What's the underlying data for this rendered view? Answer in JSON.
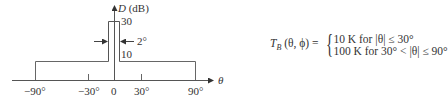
{
  "diagram": {
    "type": "piecewise directivity pattern",
    "y_axis": {
      "label_var": "D",
      "label_unit": "(dB)",
      "ticks": [
        "30",
        "10"
      ]
    },
    "x_axis": {
      "label": "θ",
      "ticks": [
        "−90°",
        "−30°",
        "0",
        "30°",
        "90°"
      ]
    },
    "annotations": {
      "beamwidth": "2°"
    },
    "levels": [
      {
        "name": "main_lobe",
        "value_db": 30,
        "width_deg": 2
      },
      {
        "name": "sidelobe",
        "value_db": 10,
        "range_deg": [
          -90,
          90
        ]
      }
    ]
  },
  "formula": {
    "lhs_T": "T",
    "lhs_sub": "B",
    "lhs_args": "(θ, ϕ) =",
    "case1": "10 K for |θ| ≤ 30°",
    "case2": "100 K for 30° < |θ| ≤ 90°"
  }
}
